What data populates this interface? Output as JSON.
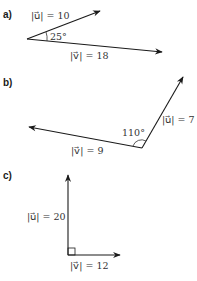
{
  "figure": {
    "parts": [
      {
        "label": "a)",
        "u_label": "|u⃗| = 10",
        "v_label": "|v⃗| = 18",
        "angle_label": "25°"
      },
      {
        "label": "b)",
        "u_label": "|u⃗| = 7",
        "v_label": "|v⃗| = 9",
        "angle_label": "110°"
      },
      {
        "label": "c)",
        "u_label": "|u⃗| = 20",
        "v_label": "|v⃗| = 12",
        "angle_label": ""
      }
    ],
    "colors": {
      "ink": "#1a1a1a",
      "background": "#ffffff"
    }
  }
}
